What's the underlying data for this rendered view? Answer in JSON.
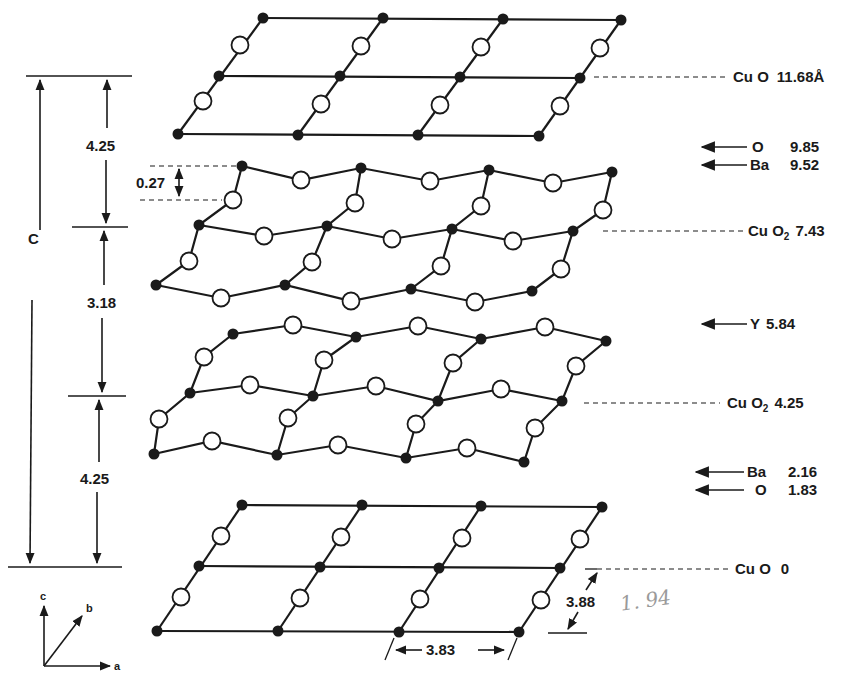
{
  "figure": {
    "unit_cell_label": "C",
    "colors": {
      "line": "#1a1a1a",
      "background": "#ffffff",
      "handwriting": "#9a9a9a"
    },
    "legend": {
      "copper_atom": "filled circle",
      "oxygen_atom": "open circle"
    }
  },
  "layer_labels": [
    {
      "id": "cuo-top",
      "species": "Cu O",
      "subscript": "",
      "value": "11.68Å",
      "kind": "plane"
    },
    {
      "id": "o-top",
      "species": "O",
      "value": "9.85",
      "kind": "arrow"
    },
    {
      "id": "ba-top",
      "species": "Ba",
      "value": "9.52",
      "kind": "arrow"
    },
    {
      "id": "cuo2-upper",
      "species": "Cu O",
      "subscript": "2",
      "value": "7.43",
      "kind": "plane"
    },
    {
      "id": "y",
      "species": "Y",
      "value": "5.84",
      "kind": "arrow"
    },
    {
      "id": "cuo2-lower",
      "species": "Cu O",
      "subscript": "2",
      "value": "4.25",
      "kind": "plane"
    },
    {
      "id": "ba-bottom",
      "species": "Ba",
      "value": "2.16",
      "kind": "arrow"
    },
    {
      "id": "o-bottom",
      "species": "O",
      "value": "1.83",
      "kind": "arrow"
    },
    {
      "id": "cuo-bottom",
      "species": "Cu O",
      "subscript": "",
      "value": "0",
      "kind": "plane"
    }
  ],
  "dimensions": {
    "spacing_top": "4.25",
    "spacing_middle": "3.18",
    "spacing_bottom": "4.25",
    "buckling": "0.27",
    "lattice_a": "3.83",
    "lattice_b": "3.88",
    "handwritten_note": "1. 94"
  },
  "axes": {
    "c": "c",
    "b": "b",
    "a": "a"
  }
}
